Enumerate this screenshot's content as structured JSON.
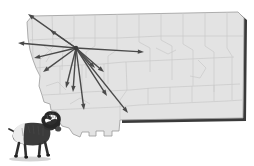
{
  "figure": {
    "type": "thematic-map",
    "background_color": "#ffffff"
  },
  "map": {
    "name": "montana-state-map",
    "fill_color": "#e3e3e3",
    "county_line_color": "#c8c8c8",
    "outline_color": "#9a9a9a",
    "shadow_color": "#3a3a3a",
    "outline_path": "M 27,22 L 32,16 L 238,12 L 244,18 L 243,118 L 120,120 L 119,131 L 112,131 L 112,136 L 104,136 L 104,131 L 96,131 L 96,136 L 89,136 L 89,132 L 82,132 L 80,137 L 73,134 L 69,128 L 62,126 L 58,120 L 57,112 L 51,110 L 50,104 L 44,102 L 42,95 L 39,86 L 40,76 L 36,68 L 33,60 L 30,50 L 28,38 Z",
    "county_lines": [
      "M 32,16 L 33,60",
      "M 52,14 L 53,47 L 40,60 L 40,76",
      "M 74,14 L 74,40 L 63,48 L 62,70",
      "M 95,13 L 95,46 L 86,52 L 86,78",
      "M 117,13 L 117,50 L 108,56 L 108,84",
      "M 139,13 L 139,42 L 150,48 L 150,72",
      "M 161,12 L 161,40 L 172,46 L 172,80",
      "M 183,12 L 183,44 L 193,50 L 193,86",
      "M 205,12 L 205,46 L 214,52 L 214,92",
      "M 227,12 L 227,48 L 232,56 L 232,100",
      "M 30,40 L 52,39 L 74,38 L 95,38 L 117,38 L 139,37 L 161,36 L 183,36 L 205,36 L 227,36 L 243,36",
      "M 36,68 L 58,66 L 80,65 L 102,64 L 124,62 L 146,61 L 168,60 L 190,59 L 212,58 L 234,57",
      "M 42,95 L 64,94 L 86,92 L 108,91 L 130,90 L 152,88 L 174,87 L 196,86 L 218,85 L 240,84",
      "M 51,110 L 73,109 L 95,108 L 117,107 L 139,105 L 161,104 L 183,103 L 205,102 L 227,101 L 242,100",
      "M 126,62 L 127,90 L 120,100 L 120,120",
      "M 148,88 L 148,104",
      "M 170,87 L 170,103",
      "M 192,86 L 192,102",
      "M 214,85 L 214,101",
      "M 104,64 L 104,91",
      "M 82,65 L 82,92",
      "M 60,66 L 60,94",
      "M 156,48 L 168,54 L 176,50",
      "M 198,60 L 206,68 L 200,78 L 190,76",
      "M 44,46 L 52,52 L 46,62"
    ]
  },
  "arrows": {
    "name": "dispersal-arrows",
    "color": "#4a4a4a",
    "line_width": 1.4,
    "origin": {
      "x": 76,
      "y": 48,
      "label": "release-hub"
    },
    "targets": [
      {
        "x": 28,
        "y": 14,
        "label": "arrow-northwest-far"
      },
      {
        "x": 50,
        "y": 30,
        "label": "arrow-north"
      },
      {
        "x": 18,
        "y": 43,
        "label": "arrow-west"
      },
      {
        "x": 34,
        "y": 58,
        "label": "arrow-west-southwest"
      },
      {
        "x": 43,
        "y": 72,
        "label": "arrow-southwest"
      },
      {
        "x": 66,
        "y": 88,
        "label": "arrow-south-near"
      },
      {
        "x": 73,
        "y": 92,
        "label": "arrow-south"
      },
      {
        "x": 84,
        "y": 110,
        "label": "arrow-south-far"
      },
      {
        "x": 95,
        "y": 68,
        "label": "arrow-southeast-near"
      },
      {
        "x": 104,
        "y": 72,
        "label": "arrow-southeast"
      },
      {
        "x": 107,
        "y": 96,
        "label": "arrow-south-southeast"
      },
      {
        "x": 128,
        "y": 113,
        "label": "arrow-southeast-far"
      },
      {
        "x": 144,
        "y": 52,
        "label": "arrow-east"
      }
    ]
  },
  "illustration": {
    "name": "bighorn-sheep",
    "alt_text": "bighorn sheep ram standing, side view",
    "position": {
      "x": 6,
      "y": 116,
      "width": 50,
      "height": 46
    },
    "body_color": "#3b3b3b",
    "rump_color": "#ededed",
    "horn_color": "#2a2a2a",
    "shadow_color": "#cccccc"
  }
}
